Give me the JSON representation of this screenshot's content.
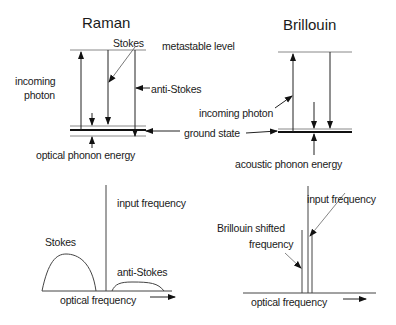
{
  "raman": {
    "title": "Raman",
    "labels": {
      "stokes": "Stokes",
      "metastable": "metastable level",
      "incoming_line1": "incoming",
      "incoming_line2": "photon",
      "anti_stokes": "anti-Stokes",
      "ground_state": "ground state",
      "optical_phonon": "optical phonon energy"
    },
    "spectrum": {
      "stokes": "Stokes",
      "input": "input frequency",
      "anti_stokes": "anti-Stokes",
      "xlabel": "optical frequency"
    }
  },
  "brillouin": {
    "title": "Brillouin",
    "labels": {
      "incoming": "incoming photon",
      "acoustic_phonon": "acoustic phonon energy"
    },
    "spectrum": {
      "shifted_line1": "Brillouin shifted",
      "shifted_line2": "frequency",
      "input": "input frequency",
      "xlabel": "optical frequency"
    }
  },
  "colors": {
    "line": "#222222",
    "thin": "#777777"
  }
}
